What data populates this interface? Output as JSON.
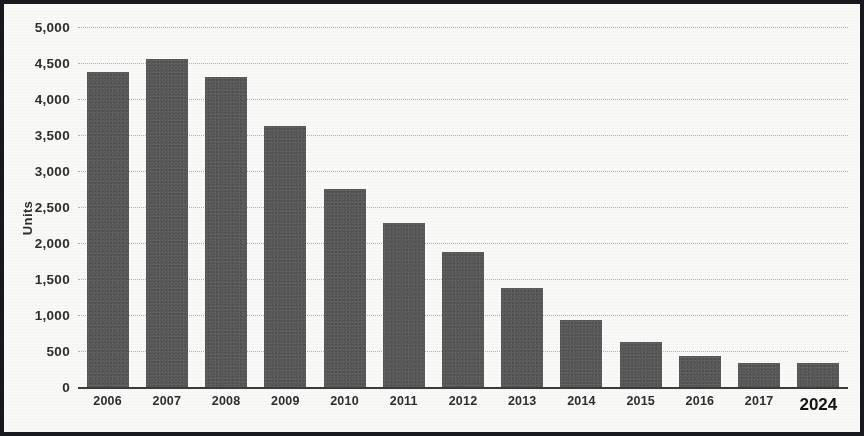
{
  "chart_data": {
    "type": "bar",
    "title": "",
    "subtitle": "",
    "xlabel": "",
    "ylabel": "Units",
    "categories": [
      "2006",
      "2007",
      "2008",
      "2009",
      "2010",
      "2011",
      "2012",
      "2013",
      "2014",
      "2015",
      "2016",
      "2017",
      "2024"
    ],
    "values": [
      4370,
      4560,
      4300,
      3620,
      2750,
      2280,
      1880,
      1370,
      930,
      620,
      430,
      330,
      330
    ],
    "ylim": [
      0,
      5000
    ],
    "ytick_values": [
      0,
      500,
      1000,
      1500,
      2000,
      2500,
      3000,
      3500,
      4000,
      4500,
      5000
    ],
    "ytick_labels": [
      "0",
      "500",
      "1,000",
      "1,500",
      "2,000",
      "2,500",
      "3,000",
      "3,500",
      "4,000",
      "4,500",
      "5,000"
    ],
    "grid": true,
    "legend": false,
    "legend_position": "none",
    "series": [
      {
        "name": "Units",
        "color": "#595959",
        "values": [
          4370,
          4560,
          4300,
          3620,
          2750,
          2280,
          1880,
          1370,
          930,
          620,
          430,
          330,
          330
        ]
      }
    ],
    "emphasized_category": "2024",
    "annotations": []
  },
  "style": {
    "bar_color": "#595959",
    "grid_color": "#a9a9a6",
    "axis_color": "#3a3a3a",
    "text_color": "#2b2b2b",
    "frame_color": "#15161a",
    "background": "#fdfdfc"
  }
}
